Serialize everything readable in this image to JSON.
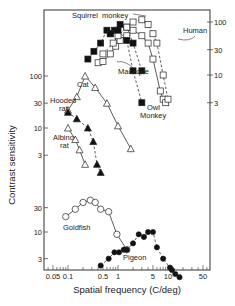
{
  "chart_data": {
    "type": "line",
    "title": "",
    "xlabel": "Spatial frequency (C/deg)",
    "ylabel": "Contrast sensitivity",
    "xscale": "log",
    "xlim": [
      0.035,
      70
    ],
    "x_ticks": [
      {
        "value": 0.05,
        "label": "0.05"
      },
      {
        "value": 0.1,
        "label": "0.1"
      },
      {
        "value": 0.5,
        "label": "0.5"
      },
      {
        "value": 1,
        "label": "1"
      },
      {
        "value": 5,
        "label": "5"
      },
      {
        "value": 10,
        "label": "10"
      },
      {
        "value": 50,
        "label": "50"
      }
    ],
    "grid": false,
    "panels": [
      {
        "name": "primates",
        "axis": "right",
        "y_ticks": [
          {
            "value": 100,
            "label": "100"
          },
          {
            "value": 30,
            "label": "30"
          },
          {
            "value": 10,
            "label": "10"
          },
          {
            "value": 3,
            "label": "3"
          }
        ],
        "series": [
          {
            "name": "Squirrel monkey",
            "marker": "square-filled",
            "line": "dashed",
            "x": [
              0.25,
              0.33,
              0.45,
              0.6,
              0.7,
              0.85,
              1.1,
              1.5,
              2.0,
              3.0
            ],
            "y": [
              20,
              28,
              40,
              70,
              60,
              70,
              90,
              80,
              40,
              12
            ]
          },
          {
            "name": "Macaque",
            "marker": "square-open",
            "line": "solid",
            "x": [
              0.4,
              0.5,
              0.7,
              0.9,
              1.1,
              1.5,
              2.0,
              3.0,
              4.0,
              5.0,
              7.0,
              8.0,
              9.0
            ],
            "y": [
              17,
              18,
              25,
              35,
              45,
              55,
              70,
              55,
              40,
              20,
              5,
              3.5,
              3
            ]
          },
          {
            "name": "Human",
            "marker": "square-open",
            "line": "dashed",
            "x": [
              0.5,
              0.8,
              1.0,
              1.5,
              2.0,
              3.0,
              4.0,
              5.0,
              6.0,
              8.0,
              10.0
            ],
            "y": [
              25,
              40,
              55,
              80,
              100,
              110,
              90,
              60,
              40,
              10,
              3.5
            ]
          },
          {
            "name": "Owl Monkey",
            "marker": "square-filled",
            "line": "dashed",
            "x": [
              0.7,
              1.0,
              1.5,
              2.0,
              3.0
            ],
            "y": [
              60,
              70,
              45,
              12,
              3
            ]
          }
        ]
      },
      {
        "name": "cat-rats",
        "axis": "left",
        "y_ticks": [
          {
            "value": 100,
            "label": "100"
          },
          {
            "value": 30,
            "label": "30"
          },
          {
            "value": 10,
            "label": "10"
          },
          {
            "value": 3,
            "label": "3"
          }
        ],
        "series": [
          {
            "name": "Cat",
            "marker": "triangle-open",
            "line": "solid",
            "x": [
              0.1,
              0.15,
              0.22,
              0.35,
              0.6,
              1.0,
              1.8
            ],
            "y": [
              22,
              40,
              100,
              60,
              30,
              11,
              4
            ]
          },
          {
            "name": "Hooded rat",
            "marker": "triangle-filled",
            "line": "dashed",
            "x": [
              0.1,
              0.15,
              0.25,
              0.32,
              0.38,
              0.45
            ],
            "y": [
              20,
              15,
              10,
              5.5,
              2,
              1.4
            ]
          },
          {
            "name": "Albino rat",
            "marker": "triangle-open",
            "line": "solid",
            "x": [
              0.1,
              0.14,
              0.17,
              0.22
            ],
            "y": [
              10,
              6,
              3.8,
              2
            ]
          }
        ]
      },
      {
        "name": "fish-bird",
        "axis": "left",
        "y_ticks": [
          {
            "value": 30,
            "label": "30"
          },
          {
            "value": 10,
            "label": "10"
          },
          {
            "value": 3,
            "label": "3"
          }
        ],
        "series": [
          {
            "name": "Goldfish",
            "marker": "circle-open",
            "line": "solid",
            "x": [
              0.09,
              0.14,
              0.2,
              0.28,
              0.35,
              0.45,
              0.65,
              0.95,
              1.5
            ],
            "y": [
              20,
              28,
              38,
              42,
              38,
              28,
              25,
              9,
              4.5
            ]
          },
          {
            "name": "Pigeon",
            "marker": "circle-filled",
            "line": "dashed",
            "x": [
              0.45,
              0.65,
              0.85,
              1.05,
              1.3,
              1.5,
              2.0,
              2.6,
              3.3,
              4.0,
              5.0,
              6.0,
              8.0,
              11,
              12,
              14,
              17
            ],
            "y": [
              2.2,
              3.0,
              4.0,
              4.0,
              4.5,
              4.5,
              6.0,
              9.0,
              8.0,
              10,
              10,
              5.0,
              3.0,
              2.0,
              1.8,
              1.5,
              1.3
            ]
          }
        ]
      }
    ]
  },
  "labels": {
    "squirrel_monkey": "Squirrel  monkey",
    "human": "Human",
    "macaque": "Macaque",
    "cat": "Cat",
    "hooded_rat_1": "Hooded",
    "hooded_rat_2": "rat",
    "albino_rat_1": "Albino",
    "albino_rat_2": "rat",
    "owl_monkey_1": "Owl",
    "owl_monkey_2": "Monkey",
    "goldfish": "Goldfish",
    "pigeon": "Pigeon"
  }
}
